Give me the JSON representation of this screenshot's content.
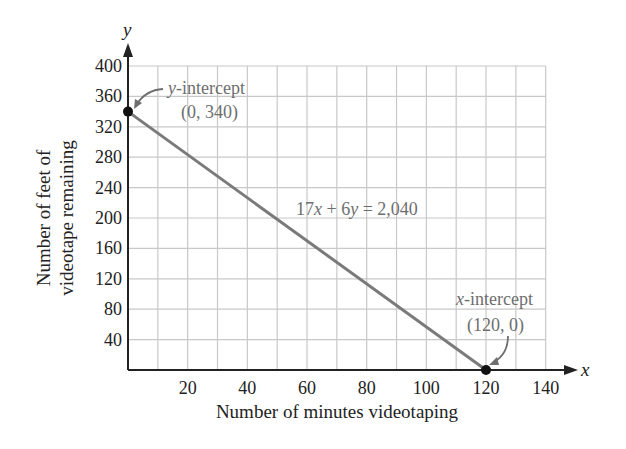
{
  "chart_data": {
    "type": "line",
    "title": "",
    "xlabel": "Number of minutes videotaping",
    "ylabel_line1": "Number of feet of",
    "ylabel_line2": "videotape remaining",
    "x_axis_symbol": "x",
    "y_axis_symbol": "y",
    "xlim": [
      0,
      140
    ],
    "ylim": [
      0,
      400
    ],
    "x_ticks": [
      20,
      40,
      60,
      80,
      100,
      120,
      140
    ],
    "y_ticks": [
      40,
      80,
      120,
      160,
      200,
      240,
      280,
      320,
      360,
      400
    ],
    "grid": true,
    "grid_x_step": 10,
    "grid_y_step": 40,
    "series": [
      {
        "name": "17x + 6y = 2,040",
        "x": [
          0,
          120
        ],
        "y": [
          340,
          0
        ],
        "color": "#7a7a7a"
      }
    ],
    "points": [
      {
        "x": 0,
        "y": 340,
        "label": "y-intercept",
        "coords": "(0, 340)"
      },
      {
        "x": 120,
        "y": 0,
        "label": "x-intercept",
        "coords": "(120, 0)"
      }
    ],
    "equation": {
      "text": "17x + 6y = 2,040",
      "parts": [
        "17",
        "x",
        " + 6",
        "y",
        " = 2,040"
      ]
    },
    "annotations": {
      "y_intercept": {
        "var": "y",
        "suffix": "-intercept",
        "coords": "(0, 340)"
      },
      "x_intercept": {
        "var": "x",
        "suffix": "-intercept",
        "coords": "(120, 0)"
      }
    },
    "legend": null
  }
}
